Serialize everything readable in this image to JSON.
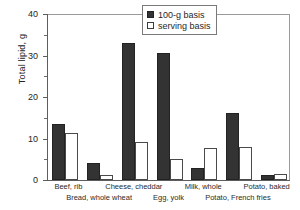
{
  "chart_data": {
    "type": "bar",
    "title": "",
    "xlabel": "",
    "ylabel": "Total lipid, g",
    "ylim": [
      0,
      40
    ],
    "ytick_labels": [
      "0",
      "10",
      "20",
      "30",
      "40"
    ],
    "ytick_values": [
      0,
      10,
      20,
      30,
      40
    ],
    "yminor_values": [
      5,
      15,
      25,
      35
    ],
    "grid": false,
    "legend_position": "top-right",
    "categories": [
      "Beef, rib",
      "Bread, whole wheat",
      "Cheese, cheddar",
      "Egg, yolk",
      "Milk, whole",
      "Potato, French fries",
      "Potato, baked"
    ],
    "category_rows": [
      0,
      1,
      0,
      1,
      0,
      1,
      0
    ],
    "series": [
      {
        "name": "100-g basis",
        "color": "#333333",
        "values": [
          13.5,
          4.2,
          33.0,
          30.6,
          3.0,
          16.2,
          1.2
        ]
      },
      {
        "name": "serving basis",
        "color": "#ffffff",
        "values": [
          11.4,
          1.2,
          9.2,
          5.0,
          7.8,
          8.0,
          1.4
        ]
      }
    ]
  },
  "legend": {
    "items": [
      {
        "label": "100-g basis",
        "style": "dark"
      },
      {
        "label": "serving basis",
        "style": "light"
      }
    ]
  }
}
